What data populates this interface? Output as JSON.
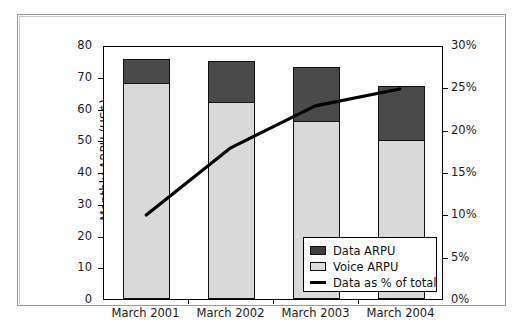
{
  "chart_data": {
    "type": "bar",
    "title": "",
    "xlabel": "",
    "ylabel": "Monthly ARPU (US$)",
    "y2label": "Data as % of total",
    "categories": [
      "March 2001",
      "March 2002",
      "March 2003",
      "March 2004"
    ],
    "ylim": [
      0,
      80
    ],
    "yticks": [
      0,
      10,
      20,
      30,
      40,
      50,
      60,
      70,
      80
    ],
    "ytick_labels": [
      "0",
      "10",
      "20",
      "30",
      "40",
      "50",
      "60",
      "70",
      "80"
    ],
    "y2lim": [
      0,
      30
    ],
    "y2ticks": [
      0,
      5,
      10,
      15,
      20,
      25,
      30
    ],
    "y2tick_labels": [
      "0%",
      "5%",
      "10%",
      "15%",
      "20%",
      "25%",
      "30%"
    ],
    "grid": false,
    "stacked": true,
    "legend_position": "lower-right-inside",
    "series": [
      {
        "name": "Voice ARPU",
        "type": "bar",
        "axis": "left",
        "color": "#d9d9d9",
        "values": [
          68,
          62,
          56,
          50
        ]
      },
      {
        "name": "Data ARPU",
        "type": "bar",
        "axis": "left",
        "color": "#4a4a4a",
        "values": [
          7.5,
          13,
          17,
          17
        ]
      },
      {
        "name": "Data as % of total",
        "type": "line",
        "axis": "right",
        "color": "#000000",
        "values": [
          10,
          18,
          23,
          25
        ]
      }
    ],
    "totals": [
      75.5,
      75,
      73,
      67
    ]
  },
  "legend": {
    "items": [
      {
        "label": "Data ARPU",
        "swatch": "dark-square"
      },
      {
        "label": "Voice ARPU",
        "swatch": "light-square"
      },
      {
        "label": "Data as % of total",
        "swatch": "black-line"
      }
    ]
  }
}
